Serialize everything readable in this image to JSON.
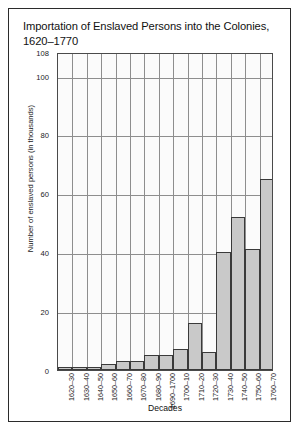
{
  "chart_data": {
    "type": "bar",
    "title": "Importation of Enslaved Persons into the Colonies, 1620–1770",
    "xlabel": "Decades",
    "ylabel": "Number of enslaved persons (in thousands)",
    "categories": [
      "1620–30",
      "1630–40",
      "1640–50",
      "1650–60",
      "1660–70",
      "1670–80",
      "1680–90",
      "1690–1700",
      "1700–10",
      "1710–20",
      "1720–30",
      "1730–40",
      "1740–50",
      "1750–60",
      "1760–70"
    ],
    "values": [
      1,
      1,
      1,
      2,
      3,
      3,
      5,
      5,
      7,
      16,
      6,
      40,
      52,
      41,
      65
    ],
    "ylim": [
      0,
      108
    ],
    "yticks": [
      0,
      20,
      40,
      60,
      80,
      100,
      108
    ],
    "ytick_labels": [
      "0",
      "20",
      "40",
      "60",
      "80",
      "100",
      "108"
    ],
    "grid": true,
    "legend": "none",
    "bar_fill": "#c9c9c9",
    "bar_stroke": "#3a3a3a",
    "plot_background": "#fbfbfb",
    "grid_color": "#8e8e8e"
  }
}
